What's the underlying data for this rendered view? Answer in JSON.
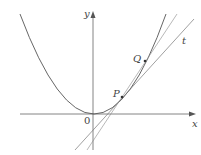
{
  "diagram": {
    "type": "parabola-tangent-secant",
    "labels": {
      "y_axis": "y",
      "x_axis": "x",
      "origin": "0",
      "point_p": "P",
      "point_q": "Q",
      "tangent": "t"
    },
    "colors": {
      "curve": "#555555",
      "axis": "#666666",
      "line": "#777777",
      "point": "#333333"
    }
  }
}
